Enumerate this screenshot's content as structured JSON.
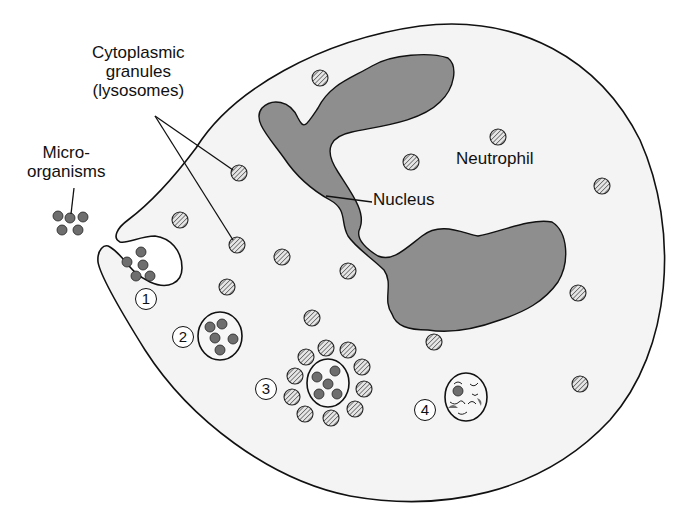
{
  "diagram": {
    "colors": {
      "cell_fill": "#f4f4f4",
      "nucleus_fill": "#8e8e8e",
      "organism_fill": "#6e6e6e",
      "outline": "#111111"
    },
    "labels": {
      "granules_line1": "Cytoplasmic",
      "granules_line2": "granules",
      "granules_line3": "(lysosomes)",
      "microorganisms_line1": "Micro-",
      "microorganisms_line2": "organisms",
      "nucleus": "Nucleus",
      "cell": "Neutrophil"
    },
    "stages": [
      {
        "number": "1",
        "description": "Engulfment of microorganisms by pseudopod"
      },
      {
        "number": "2",
        "description": "Phagosome formed"
      },
      {
        "number": "3",
        "description": "Granules surround phagosome"
      },
      {
        "number": "4",
        "description": "Digestion of microorganisms"
      }
    ]
  }
}
